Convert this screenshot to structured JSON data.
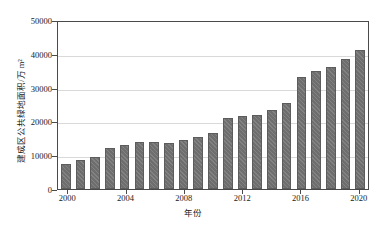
{
  "chart_data": {
    "type": "bar",
    "title": "",
    "xlabel": "年份",
    "ylabel": "建成区公共绿地面积/万 m²",
    "categories": [
      "2000",
      "2001",
      "2002",
      "2003",
      "2004",
      "2005",
      "2006",
      "2007",
      "2008",
      "2009",
      "2010",
      "2011",
      "2012",
      "2013",
      "2014",
      "2015",
      "2016",
      "2017",
      "2018",
      "2019",
      "2020"
    ],
    "values": [
      7300,
      8500,
      9500,
      12000,
      13000,
      14000,
      14000,
      13500,
      14500,
      15500,
      16500,
      21000,
      21500,
      22000,
      23500,
      25500,
      33000,
      35000,
      36000,
      38500,
      41000
    ],
    "ylim": [
      0,
      50000
    ],
    "yticks": [
      0,
      10000,
      20000,
      30000,
      40000,
      50000
    ],
    "ytick_labels": [
      "0",
      "10000",
      "20000",
      "30000",
      "40000",
      "50000"
    ],
    "xticks": [
      "2000",
      "2004",
      "2008",
      "2012",
      "2016",
      "2020"
    ],
    "grid": true,
    "legend": null,
    "series_color": "#6e6e6e"
  }
}
